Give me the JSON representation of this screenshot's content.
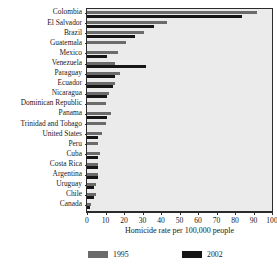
{
  "chart_data": {
    "type": "bar",
    "orientation": "horizontal",
    "title": "",
    "xlabel": "Homicide rate per 100,000 people",
    "ylabel": "",
    "xlim": [
      0,
      100
    ],
    "xticks": [
      0,
      10,
      20,
      30,
      40,
      50,
      60,
      70,
      80,
      90,
      100
    ],
    "grid": false,
    "legend_position": "bottom",
    "categories": [
      "Colombia",
      "El Salvador",
      "Brazil",
      "Guatemala",
      "Mexico",
      "Venezuela",
      "Paraguay",
      "Ecuador",
      "Nicaragua",
      "Dominican Republic",
      "Panama",
      "Trinidad and Tobago",
      "United States",
      "Peru",
      "Cuba",
      "Costa Rica",
      "Argentina",
      "Uruguay",
      "Chile",
      "Canada"
    ],
    "series": [
      {
        "name": "1995",
        "color": "#6b6b6b",
        "values": [
          92,
          43,
          31,
          21,
          17,
          15,
          18,
          15,
          12,
          10,
          13,
          10,
          8,
          6,
          7,
          6,
          6,
          5,
          5,
          2
        ]
      },
      {
        "name": "2002",
        "color": "#161616",
        "values": [
          84,
          36,
          26,
          null,
          11,
          32,
          15,
          14,
          11,
          null,
          11,
          null,
          6,
          null,
          6,
          6,
          6,
          4,
          4,
          1.5
        ]
      }
    ]
  },
  "legend": {
    "entries": [
      {
        "label": "1995"
      },
      {
        "label": "2002"
      }
    ]
  },
  "axis": {
    "x_title": "Homicide rate per 100,000 people"
  }
}
